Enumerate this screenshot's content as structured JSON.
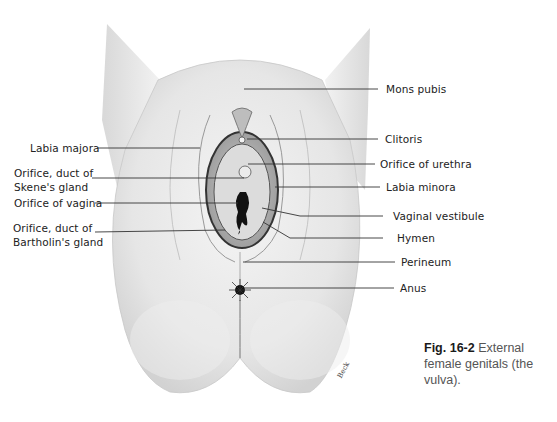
{
  "figure": {
    "number": "Fig. 16-2",
    "caption": "External female genitals (the vulva).",
    "signature": "Beck"
  },
  "labels_left": [
    {
      "id": "labia-majora",
      "text": "Labia majora"
    },
    {
      "id": "skenes-gland",
      "text": "Orifice, duct of\nSkene's gland"
    },
    {
      "id": "vagina-orifice",
      "text": "Orifice of vagina"
    },
    {
      "id": "bartholins-gland",
      "text": "Orifice, duct of\nBartholin's gland"
    }
  ],
  "labels_right": [
    {
      "id": "mons-pubis",
      "text": "Mons pubis"
    },
    {
      "id": "clitoris",
      "text": "Clitoris"
    },
    {
      "id": "urethra-orifice",
      "text": "Orifice of urethra"
    },
    {
      "id": "labia-minora",
      "text": "Labia minora"
    },
    {
      "id": "vaginal-vestibule",
      "text": "Vaginal vestibule"
    },
    {
      "id": "hymen",
      "text": "Hymen"
    },
    {
      "id": "perineum",
      "text": "Perineum"
    },
    {
      "id": "anus",
      "text": "Anus"
    }
  ],
  "colors": {
    "background": "#ffffff",
    "label_text": "#222222",
    "leader_line": "#333333",
    "caption_text": "#555555"
  }
}
